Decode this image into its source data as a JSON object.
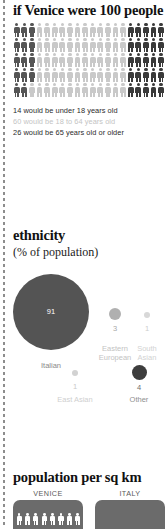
{
  "chart_data": [
    {
      "type": "pictogram",
      "title": "if Venice were 100 people",
      "unit_total": 100,
      "columns": 20,
      "rows": 5,
      "categories": [
        "under 18 years old",
        "18 to 64 years old",
        "65 years old or older"
      ],
      "values": [
        14,
        60,
        26
      ],
      "colors": [
        "#555555",
        "#c9c9c9",
        "#3a3a3a"
      ],
      "legend": [
        "14 would be under 18 years old",
        "60 would be 18 to 64 years old",
        "26 would be 65 years old or older"
      ],
      "legend_colors": [
        "#555555",
        "#c9c9c9",
        "#3a3a3a"
      ]
    },
    {
      "type": "bubble",
      "title": "ethnicity",
      "subtitle": "(% of population)",
      "ylabel": "% of population",
      "categories": [
        "Italian",
        "Eastern European",
        "South Asian",
        "East Asian",
        "Other"
      ],
      "values": [
        91,
        3,
        1,
        1,
        4
      ],
      "labels": [
        "91",
        "3",
        "1",
        "1",
        "4"
      ],
      "colors": [
        "#545454",
        "#b0b0b0",
        "#d2d2d2",
        "#d2d2d2",
        "#3d3d3d"
      ]
    },
    {
      "type": "bar",
      "title": "population per sq km",
      "categories": [
        "VENICE",
        "ITALY"
      ],
      "values": [
        null,
        null
      ],
      "colors": [
        "#6b6b6b",
        "#6b6b6b"
      ]
    }
  ],
  "section_people": {
    "title": "if Venice were 100 people",
    "legend": [
      {
        "text": "14 would be under 18 years old",
        "color": "#2b2b2b"
      },
      {
        "text": "60 would be 18 to 64 years old",
        "color": "#c4c4c4"
      },
      {
        "text": "26 would be 65 years old or older",
        "color": "#2b2b2b"
      }
    ]
  },
  "section_ethnicity": {
    "title": "ethnicity",
    "subtitle": "(% of population)",
    "bubbles": [
      {
        "label": "Italian",
        "value": "91"
      },
      {
        "label_line1": "Eastern",
        "label_line2": "European",
        "value": "3"
      },
      {
        "label_line1": "South",
        "label_line2": "Asian",
        "value": "1"
      },
      {
        "label": "East Asian",
        "value": "1"
      },
      {
        "label": "Other",
        "value": "4"
      }
    ]
  },
  "section_density": {
    "title": "population per sq km",
    "panels": [
      {
        "caption": "VENICE"
      },
      {
        "caption": "ITALY"
      }
    ]
  }
}
